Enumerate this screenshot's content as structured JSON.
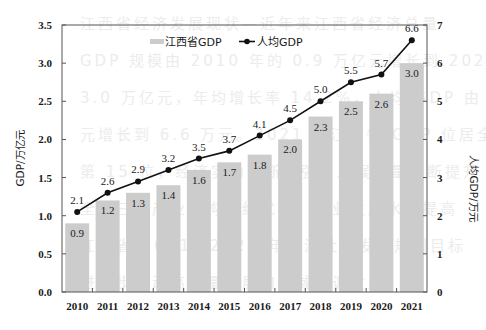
{
  "chart_data": {
    "type": "bar+line",
    "title": "",
    "categories": [
      "2010",
      "2011",
      "2012",
      "2013",
      "2014",
      "2015",
      "2016",
      "2017",
      "2018",
      "2019",
      "2020",
      "2021"
    ],
    "series": [
      {
        "name": "江西省GDP",
        "type": "bar",
        "axis": "left",
        "color": "#cccccc",
        "values": [
          0.9,
          1.2,
          1.3,
          1.4,
          1.6,
          1.7,
          1.8,
          2.0,
          2.3,
          2.5,
          2.6,
          3.0
        ],
        "labels": [
          "0.9",
          "1.2",
          "1.3",
          "1.4",
          "1.6",
          "1.7",
          "1.8",
          "2.0",
          "2.3",
          "2.5",
          "2.6",
          "3.0"
        ]
      },
      {
        "name": "人均GDP",
        "type": "line",
        "axis": "right",
        "color": "#111111",
        "marker": "circle",
        "values": [
          2.1,
          2.6,
          2.9,
          3.2,
          3.5,
          3.7,
          4.1,
          4.5,
          5.0,
          5.5,
          5.7,
          6.6
        ],
        "labels": [
          "2.1",
          "2.6",
          "2.9",
          "3.2",
          "3.5",
          "3.7",
          "4.1",
          "4.5",
          "5.0",
          "5.5",
          "5.7",
          "6.6"
        ]
      }
    ],
    "ylabel": "GDP/万亿元",
    "ylabel_right": "人均GDP/万元",
    "xlabel": "",
    "ylim": [
      0,
      3.5
    ],
    "ylim_right": [
      0,
      7
    ],
    "yticks": [
      "0.0",
      "0.5",
      "1.0",
      "1.5",
      "2.0",
      "2.5",
      "3.0",
      "3.5"
    ],
    "yticks_right": [
      "0",
      "1",
      "2",
      "3",
      "4",
      "5",
      "6",
      "7"
    ],
    "legend": {
      "position": "top-inside",
      "entries": [
        "江西省GDP",
        "人均GDP"
      ]
    },
    "grid": false
  },
  "background_text": [
    "江西省经济发展现状—近年来江西省经济总量",
    "GDP 规模由 2010 年的 0.9 万亿元增长到 2021 年的",
    "3.0 万亿元，年均增长率 14.2%，人均 GDP 由 2.1 万",
    "元增长到 6.6 万元。2021 年江西省 GDP 位居全国",
    "第 15 位，经济实力不断增强，发展质量不断提升",
    "全省三次产业结构持续优化，产业发展水平提高",
    "江西省 2021—2025 年经济社会发展规划目标",
    "进一步推动高质量发展和区域协调发展"
  ]
}
